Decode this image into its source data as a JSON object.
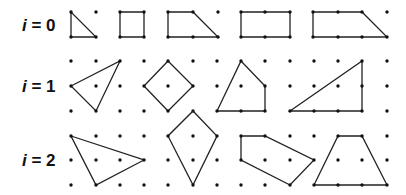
{
  "diagram": {
    "colors": {
      "line": "#222222",
      "dot": "#111111",
      "text": "#111111",
      "background": "#ffffff"
    },
    "rows": [
      {
        "label_var": "i",
        "label_rest": " = 0",
        "label_y": 31,
        "polygons": [
          {
            "name": "triangle",
            "vertices": [
              [
                71,
                12
              ],
              [
                71,
                37
              ],
              [
                96,
                37
              ]
            ]
          },
          {
            "name": "square",
            "vertices": [
              [
                120,
                12
              ],
              [
                144,
                12
              ],
              [
                144,
                37
              ],
              [
                120,
                37
              ]
            ]
          },
          {
            "name": "trapezoid",
            "vertices": [
              [
                168,
                12
              ],
              [
                193,
                12
              ],
              [
                218,
                37
              ],
              [
                168,
                37
              ]
            ]
          },
          {
            "name": "rectangle",
            "vertices": [
              [
                241,
                12
              ],
              [
                290,
                12
              ],
              [
                290,
                37
              ],
              [
                241,
                37
              ]
            ]
          },
          {
            "name": "trapezoid-wide",
            "vertices": [
              [
                313,
                12
              ],
              [
                362,
                12
              ],
              [
                387,
                37
              ],
              [
                313,
                37
              ]
            ]
          }
        ],
        "dots": [
          [
            71,
            12
          ],
          [
            96,
            12
          ],
          [
            71,
            37
          ],
          [
            96,
            37
          ],
          [
            120,
            12
          ],
          [
            144,
            12
          ],
          [
            120,
            37
          ],
          [
            144,
            37
          ],
          [
            168,
            12
          ],
          [
            193,
            12
          ],
          [
            218,
            12
          ],
          [
            168,
            37
          ],
          [
            193,
            37
          ],
          [
            218,
            37
          ],
          [
            241,
            12
          ],
          [
            265,
            12
          ],
          [
            290,
            12
          ],
          [
            241,
            37
          ],
          [
            265,
            37
          ],
          [
            290,
            37
          ],
          [
            313,
            12
          ],
          [
            338,
            12
          ],
          [
            362,
            12
          ],
          [
            387,
            12
          ],
          [
            313,
            37
          ],
          [
            338,
            37
          ],
          [
            362,
            37
          ],
          [
            387,
            37
          ]
        ]
      },
      {
        "label_var": "i",
        "label_rest": " = 1",
        "label_y": 92,
        "polygons": [
          {
            "name": "triangle",
            "vertices": [
              [
                71,
                86
              ],
              [
                120,
                61
              ],
              [
                96,
                111
              ]
            ]
          },
          {
            "name": "diamond",
            "vertices": [
              [
                168,
                61
              ],
              [
                193,
                86
              ],
              [
                168,
                111
              ],
              [
                144,
                86
              ]
            ]
          },
          {
            "name": "pentagon",
            "vertices": [
              [
                241,
                61
              ],
              [
                265,
                86
              ],
              [
                265,
                111
              ],
              [
                217,
                111
              ]
            ]
          },
          {
            "name": "right-triangle",
            "vertices": [
              [
                290,
                111
              ],
              [
                362,
                61
              ],
              [
                362,
                111
              ]
            ]
          }
        ],
        "dots": [
          [
            71,
            61
          ],
          [
            96,
            61
          ],
          [
            120,
            61
          ],
          [
            71,
            86
          ],
          [
            96,
            86
          ],
          [
            120,
            86
          ],
          [
            71,
            111
          ],
          [
            96,
            111
          ],
          [
            120,
            111
          ],
          [
            144,
            61
          ],
          [
            168,
            61
          ],
          [
            193,
            61
          ],
          [
            144,
            86
          ],
          [
            168,
            86
          ],
          [
            193,
            86
          ],
          [
            144,
            111
          ],
          [
            168,
            111
          ],
          [
            193,
            111
          ],
          [
            217,
            61
          ],
          [
            241,
            61
          ],
          [
            265,
            61
          ],
          [
            217,
            86
          ],
          [
            241,
            86
          ],
          [
            265,
            86
          ],
          [
            217,
            111
          ],
          [
            241,
            111
          ],
          [
            265,
            111
          ],
          [
            290,
            61
          ],
          [
            314,
            61
          ],
          [
            338,
            61
          ],
          [
            362,
            61
          ],
          [
            387,
            61
          ],
          [
            290,
            86
          ],
          [
            314,
            86
          ],
          [
            338,
            86
          ],
          [
            362,
            86
          ],
          [
            387,
            86
          ],
          [
            290,
            111
          ],
          [
            314,
            111
          ],
          [
            338,
            111
          ],
          [
            362,
            111
          ],
          [
            387,
            111
          ]
        ]
      },
      {
        "label_var": "i",
        "label_rest": " = 2",
        "label_y": 166,
        "polygons": [
          {
            "name": "triangle",
            "vertices": [
              [
                71,
                136
              ],
              [
                144,
                160
              ],
              [
                96,
                185
              ]
            ]
          },
          {
            "name": "kite",
            "vertices": [
              [
                193,
                111
              ],
              [
                217,
                136
              ],
              [
                193,
                185
              ],
              [
                168,
                136
              ]
            ]
          },
          {
            "name": "pentagon",
            "vertices": [
              [
                241,
                136
              ],
              [
                265,
                136
              ],
              [
                314,
                160
              ],
              [
                290,
                185
              ],
              [
                241,
                160
              ]
            ]
          },
          {
            "name": "trapezoid",
            "vertices": [
              [
                338,
                136
              ],
              [
                362,
                136
              ],
              [
                387,
                185
              ],
              [
                314,
                185
              ]
            ]
          }
        ],
        "dots": [
          [
            71,
            136
          ],
          [
            96,
            136
          ],
          [
            120,
            136
          ],
          [
            144,
            136
          ],
          [
            71,
            160
          ],
          [
            96,
            160
          ],
          [
            120,
            160
          ],
          [
            144,
            160
          ],
          [
            71,
            185
          ],
          [
            96,
            185
          ],
          [
            120,
            185
          ],
          [
            144,
            185
          ],
          [
            168,
            136
          ],
          [
            193,
            136
          ],
          [
            217,
            136
          ],
          [
            168,
            160
          ],
          [
            193,
            160
          ],
          [
            217,
            160
          ],
          [
            168,
            185
          ],
          [
            193,
            185
          ],
          [
            217,
            185
          ],
          [
            241,
            136
          ],
          [
            265,
            136
          ],
          [
            290,
            136
          ],
          [
            314,
            136
          ],
          [
            241,
            160
          ],
          [
            265,
            160
          ],
          [
            290,
            160
          ],
          [
            314,
            160
          ],
          [
            241,
            185
          ],
          [
            265,
            185
          ],
          [
            290,
            185
          ],
          [
            338,
            136
          ],
          [
            362,
            136
          ],
          [
            387,
            136
          ],
          [
            338,
            160
          ],
          [
            362,
            160
          ],
          [
            387,
            160
          ],
          [
            314,
            185
          ],
          [
            338,
            185
          ],
          [
            362,
            185
          ],
          [
            387,
            185
          ]
        ]
      }
    ]
  }
}
